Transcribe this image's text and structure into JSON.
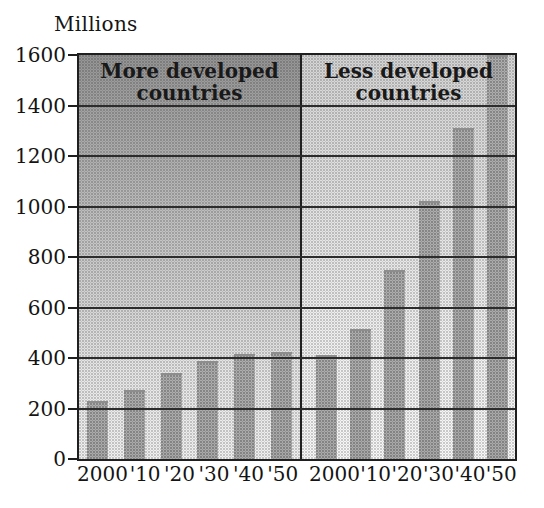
{
  "chart_data": {
    "type": "bar",
    "title": "",
    "ylabel": "Millions",
    "xlabel": "",
    "ylim": [
      0,
      1600
    ],
    "yticks": [
      0,
      200,
      400,
      600,
      800,
      1000,
      1200,
      1400,
      1600
    ],
    "grid": true,
    "legend": "none",
    "categories": [
      "2000",
      "'10",
      "'20",
      "'30",
      "'40",
      "'50"
    ],
    "series": [
      {
        "name": "More developed countries",
        "values": [
          230,
          275,
          340,
          390,
          415,
          425
        ]
      },
      {
        "name": "Less developed countries",
        "values": [
          410,
          515,
          750,
          1020,
          1310,
          1600
        ]
      }
    ],
    "panels": [
      {
        "id": "more-developed",
        "title_line1": "More developed",
        "title_line2": "countries"
      },
      {
        "id": "less-developed",
        "title_line1": "Less developed",
        "title_line2": "countries"
      }
    ]
  },
  "colors": {
    "frame": "#1f1f1f",
    "gridline": "#2c2c2c",
    "bar": "#aaaaaa",
    "panel_left_top": "#959595",
    "panel_left_bottom": "#f0f0f0",
    "panel_right_top": "#d5d5d5",
    "panel_right_bottom": "#f7f7f7",
    "text": "#141414"
  }
}
